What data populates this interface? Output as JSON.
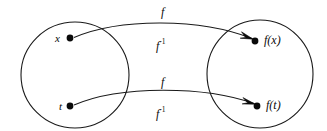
{
  "diagram": {
    "stroke_color": "#1a1a1a",
    "background_color": "#ffffff",
    "sets": [
      {
        "name": "domain-set",
        "cx": 75,
        "cy": 75,
        "rx": 54,
        "ry": 53
      },
      {
        "name": "codomain-set",
        "cx": 260,
        "cy": 74,
        "rx": 53,
        "ry": 54
      }
    ],
    "points": [
      {
        "name": "point-x",
        "label": "x",
        "dot_x": 70,
        "dot_y": 38,
        "label_x": 55,
        "label_y": 33
      },
      {
        "name": "point-t",
        "label": "t",
        "dot_x": 70,
        "dot_y": 106,
        "label_x": 58,
        "label_y": 101
      },
      {
        "name": "point-fx",
        "label": "f(x)",
        "dot_x": 255,
        "dot_y": 41,
        "label_x": 264,
        "label_y": 35
      },
      {
        "name": "point-ft",
        "label": "f(t)",
        "dot_x": 257,
        "dot_y": 106,
        "label_x": 266,
        "label_y": 100
      }
    ],
    "map_labels": [
      {
        "name": "label-f-top",
        "text": "f",
        "sup": "",
        "x": 160,
        "y": 6
      },
      {
        "name": "label-finv-top",
        "text": "f",
        "sup": "-1",
        "x": 155,
        "y": 40
      },
      {
        "name": "label-f-bottom",
        "text": "f",
        "sup": "",
        "x": 160,
        "y": 76
      },
      {
        "name": "label-finv-bottom",
        "text": "f",
        "sup": "-1",
        "x": 155,
        "y": 108
      }
    ],
    "arrows": [
      {
        "name": "arrow-x-to-fx",
        "from": "point-x",
        "to": "point-fx"
      },
      {
        "name": "arrow-t-to-ft",
        "from": "point-t",
        "to": "point-ft"
      }
    ]
  }
}
